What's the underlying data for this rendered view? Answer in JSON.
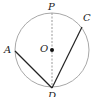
{
  "diagram": {
    "type": "circle-geometry",
    "circle": {
      "center": "O",
      "cx": 52,
      "cy": 50,
      "r": 37,
      "stroke": "#999999"
    },
    "points": {
      "P": {
        "label": "P",
        "x": 52,
        "y": 13
      },
      "C": {
        "label": "C",
        "x": 82,
        "y": 27
      },
      "A": {
        "label": "A",
        "x": 15,
        "y": 51
      },
      "O": {
        "label": "O",
        "x": 52,
        "y": 50
      },
      "D": {
        "label": "D",
        "x": 52,
        "y": 88
      }
    },
    "segments": [
      {
        "from": "P",
        "to": "D",
        "style": "dashed"
      },
      {
        "from": "A",
        "to": "D",
        "style": "solid"
      },
      {
        "from": "C",
        "to": "D",
        "style": "solid"
      }
    ]
  }
}
